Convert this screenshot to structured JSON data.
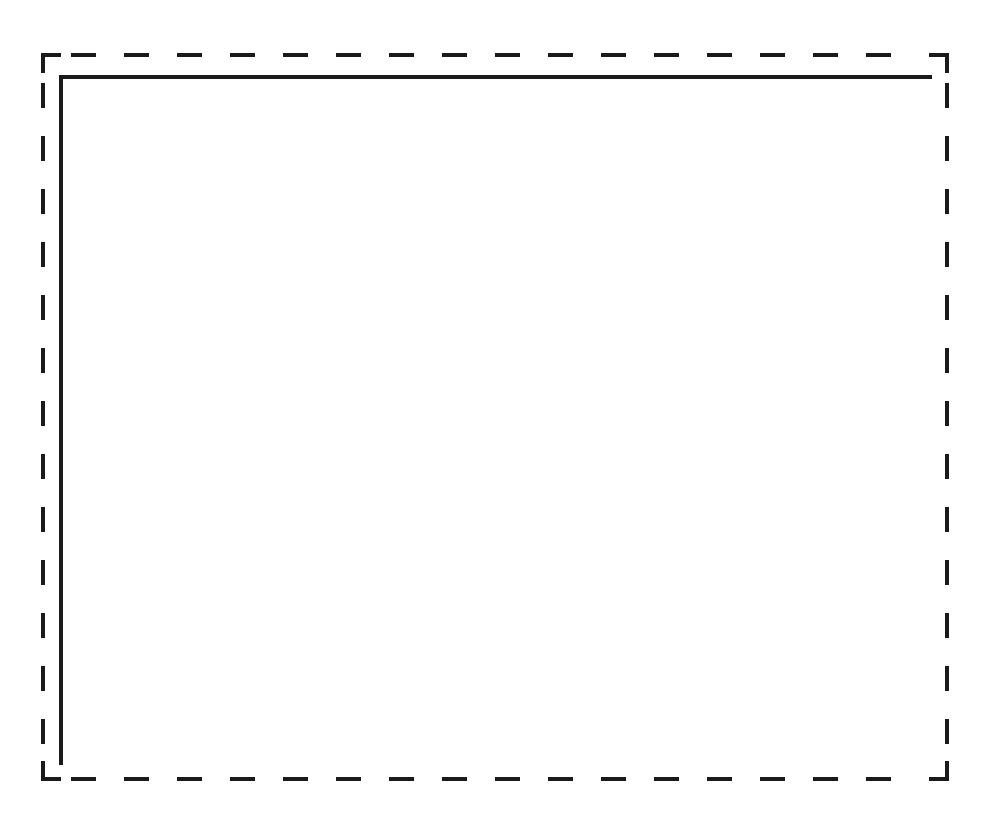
{
  "diagram": {
    "title": "",
    "background": "#ffffff",
    "stroke_color": "#1a1a1a",
    "shapes": [
      {
        "id": "dashed-rectangle",
        "kind": "rectangle",
        "style": "dashed",
        "x": 43,
        "y": 55,
        "width": 904,
        "height": 724,
        "stroke_width": 4,
        "dash": 25,
        "gap": 28
      },
      {
        "id": "solid-top-edge",
        "kind": "line",
        "style": "solid",
        "x1": 61,
        "y1": 77,
        "x2": 930,
        "y2": 77,
        "stroke_width": 4
      },
      {
        "id": "solid-left-edge",
        "kind": "line",
        "style": "solid",
        "x1": 61,
        "y1": 77,
        "x2": 61,
        "y2": 763,
        "stroke_width": 4
      }
    ],
    "labels": []
  }
}
